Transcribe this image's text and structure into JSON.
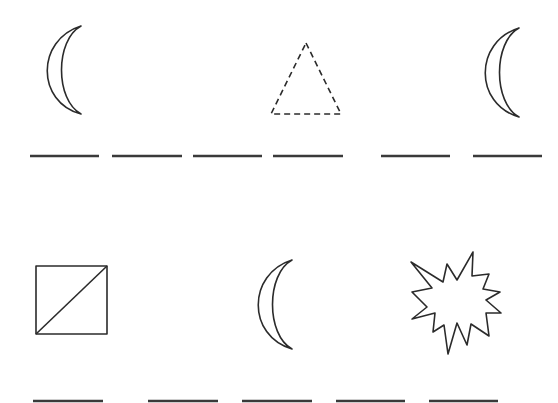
{
  "worksheet": {
    "type": "pattern-completion",
    "stroke_color": "#2b2b2b",
    "background": "#ffffff",
    "rows": [
      {
        "shapes": [
          {
            "kind": "crescent",
            "slot": 1
          },
          {
            "kind": "dashed-triangle",
            "slot": 4
          },
          {
            "kind": "crescent",
            "slot": 6
          }
        ],
        "blank_count": 6
      },
      {
        "shapes": [
          {
            "kind": "square-with-diagonal",
            "slot": 1
          },
          {
            "kind": "crescent",
            "slot": 3
          },
          {
            "kind": "starburst",
            "slot": 5
          }
        ],
        "blank_count": 5
      }
    ]
  }
}
